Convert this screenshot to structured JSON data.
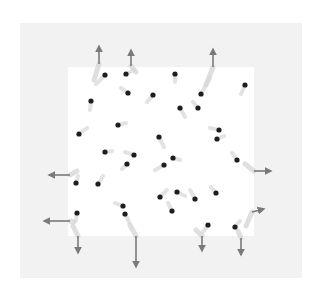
{
  "diagram": {
    "type": "particle-box-escape",
    "colors": {
      "background": "#ffffff",
      "outer_region": "#f2f2f2",
      "inner_region": "#ffffff",
      "particle": "#1e1e1e",
      "trail": "#d8d8d8",
      "arrow": "#7a7a7a"
    },
    "outer_box": {
      "x": 20,
      "y": 23,
      "w": 282,
      "h": 255
    },
    "inner_box": {
      "x": 68,
      "y": 67,
      "w": 186,
      "h": 169
    },
    "particles": [
      {
        "x": 105,
        "y": 75,
        "tx": 96,
        "ty": 84
      },
      {
        "x": 126,
        "y": 74,
        "tx": 134,
        "ty": 70
      },
      {
        "x": 128,
        "y": 93,
        "tx": 121,
        "ty": 88
      },
      {
        "x": 153,
        "y": 95,
        "tx": 147,
        "ty": 102
      },
      {
        "x": 91,
        "y": 101,
        "tx": 90,
        "ty": 110
      },
      {
        "x": 175,
        "y": 74,
        "tx": 175,
        "ty": 82
      },
      {
        "x": 201,
        "y": 94,
        "tx": 210,
        "ty": 78
      },
      {
        "x": 180,
        "y": 108,
        "tx": 185,
        "ty": 117
      },
      {
        "x": 198,
        "y": 108,
        "tx": 193,
        "ty": 102
      },
      {
        "x": 245,
        "y": 85,
        "tx": 241,
        "ty": 94
      },
      {
        "x": 79,
        "y": 134,
        "tx": 87,
        "ty": 128
      },
      {
        "x": 118,
        "y": 125,
        "tx": 126,
        "ty": 123
      },
      {
        "x": 105,
        "y": 152,
        "tx": 112,
        "ty": 151
      },
      {
        "x": 134,
        "y": 155,
        "tx": 125,
        "ty": 152
      },
      {
        "x": 127,
        "y": 164,
        "tx": 122,
        "ty": 169
      },
      {
        "x": 159,
        "y": 137,
        "tx": 164,
        "ty": 147
      },
      {
        "x": 219,
        "y": 130,
        "tx": 210,
        "ty": 128
      },
      {
        "x": 217,
        "y": 139,
        "tx": 224,
        "ty": 136
      },
      {
        "x": 173,
        "y": 158,
        "tx": 180,
        "ty": 160
      },
      {
        "x": 164,
        "y": 165,
        "tx": 155,
        "ty": 170
      },
      {
        "x": 237,
        "y": 160,
        "tx": 232,
        "ty": 153
      },
      {
        "x": 98,
        "y": 184,
        "tx": 103,
        "ty": 176
      },
      {
        "x": 76,
        "y": 183,
        "tx": 78,
        "ty": 176
      },
      {
        "x": 77,
        "y": 213,
        "tx": 76,
        "ty": 220
      },
      {
        "x": 123,
        "y": 206,
        "tx": 115,
        "ty": 203
      },
      {
        "x": 125,
        "y": 214,
        "tx": 129,
        "ty": 222
      },
      {
        "x": 160,
        "y": 197,
        "tx": 167,
        "ty": 190
      },
      {
        "x": 177,
        "y": 192,
        "tx": 185,
        "ty": 196
      },
      {
        "x": 195,
        "y": 199,
        "tx": 190,
        "ty": 190
      },
      {
        "x": 216,
        "y": 193,
        "tx": 211,
        "ty": 187
      },
      {
        "x": 172,
        "y": 211,
        "tx": 168,
        "ty": 203
      },
      {
        "x": 208,
        "y": 225,
        "tx": 203,
        "ty": 232
      },
      {
        "x": 235,
        "y": 227,
        "tx": 240,
        "ty": 221
      }
    ],
    "escape_arrows": [
      {
        "x1": 99,
        "y1": 64,
        "x2": 99,
        "y2": 46,
        "trail": [
          94,
          80
        ]
      },
      {
        "x1": 131,
        "y1": 66,
        "x2": 131,
        "y2": 50,
        "trail": [
          136,
          72
        ]
      },
      {
        "x1": 213,
        "y1": 67,
        "x2": 213,
        "y2": 49,
        "trail": [
          206,
          85
        ]
      },
      {
        "x1": 70,
        "y1": 175,
        "x2": 49,
        "y2": 175,
        "trail": [
          77,
          171
        ]
      },
      {
        "x1": 70,
        "y1": 221,
        "x2": 44,
        "y2": 221,
        "trail": [
          74,
          222
        ]
      },
      {
        "x1": 254,
        "y1": 171,
        "x2": 271,
        "y2": 171,
        "trail": [
          245,
          164
        ]
      },
      {
        "x1": 252,
        "y1": 212,
        "x2": 264,
        "y2": 209,
        "trail": [
          246,
          226
        ]
      },
      {
        "x1": 78,
        "y1": 236,
        "x2": 78,
        "y2": 253,
        "trail": [
          73,
          226
        ]
      },
      {
        "x1": 136,
        "y1": 236,
        "x2": 136,
        "y2": 267,
        "trail": [
          130,
          225
        ]
      },
      {
        "x1": 202,
        "y1": 236,
        "x2": 202,
        "y2": 251,
        "trail": [
          196,
          230
        ]
      },
      {
        "x1": 241,
        "y1": 238,
        "x2": 241,
        "y2": 255,
        "trail": [
          238,
          231
        ]
      }
    ]
  }
}
